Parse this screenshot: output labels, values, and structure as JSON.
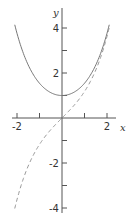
{
  "chart_data": {
    "type": "line",
    "title": "",
    "xlabel": "x",
    "ylabel": "y",
    "xlim": [
      -2.1,
      2.1
    ],
    "ylim": [
      -4.2,
      4.5
    ],
    "grid": false,
    "legend": null,
    "x_ticks": [
      -2,
      -1,
      0,
      1,
      2
    ],
    "x_tick_labels": [
      "-2",
      "",
      "",
      "",
      "2"
    ],
    "y_ticks": [
      -4,
      -3,
      -2,
      -1,
      1,
      2,
      3,
      4
    ],
    "y_tick_labels": [
      "-4",
      "",
      "-2",
      "",
      "",
      "2",
      "",
      "4"
    ],
    "series": [
      {
        "name": "cosh x",
        "style": "solid",
        "x": [
          -2.1,
          -2.0,
          -1.5,
          -1.0,
          -0.5,
          0,
          0.5,
          1.0,
          1.5,
          2.0,
          2.1
        ],
        "values": [
          4.14,
          3.76,
          2.35,
          1.54,
          1.13,
          1.0,
          1.13,
          1.54,
          2.35,
          3.76,
          4.14
        ]
      },
      {
        "name": "sinh x",
        "style": "dashed",
        "x": [
          -2.1,
          -2.0,
          -1.5,
          -1.0,
          -0.5,
          0,
          0.5,
          1.0,
          1.5,
          2.0,
          2.1
        ],
        "values": [
          -4.02,
          -3.63,
          -2.13,
          -1.18,
          -0.52,
          0,
          0.52,
          1.18,
          2.13,
          3.63,
          4.02
        ]
      }
    ]
  },
  "style": {
    "axis_color": "#555555",
    "solid_color": "#777777",
    "dashed_color": "#999999"
  },
  "layout": {
    "origin_px": [
      62,
      118
    ],
    "unit_px": 22.5
  }
}
